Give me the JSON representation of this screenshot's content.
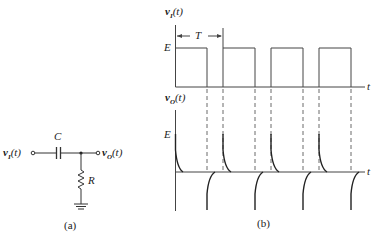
{
  "circuit": {
    "input_label": "v_I(t)",
    "input_main": "v",
    "input_sub": "I",
    "input_arg": "(t)",
    "output_main": "v",
    "output_sub": "O",
    "output_arg": "(t)",
    "capacitor_label": "C",
    "resistor_label": "R",
    "caption": "(a)"
  },
  "waveforms": {
    "input": {
      "main": "v",
      "sub": "I",
      "arg": "(t)",
      "level_label": "E",
      "period_label": "T",
      "time_label": "t"
    },
    "output": {
      "main": "v",
      "sub": "O",
      "arg": "(t)",
      "level_label": "E",
      "time_label": "t"
    },
    "caption": "(b)"
  }
}
